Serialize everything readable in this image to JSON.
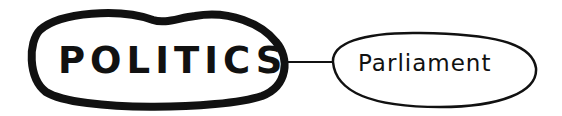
{
  "diagram": {
    "type": "mind-map",
    "central_node": {
      "label": "POLITICS",
      "shape": "thick-bordered cloud ellipse"
    },
    "child_nodes": [
      {
        "label": "Parliament",
        "shape": "thin-bordered ellipse"
      }
    ],
    "edges": [
      {
        "from": "POLITICS",
        "to": "Parliament"
      }
    ],
    "colors": {
      "ink": "#111111",
      "background": "#ffffff"
    }
  }
}
